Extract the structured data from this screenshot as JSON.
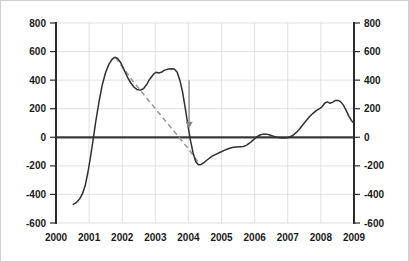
{
  "chart_data": {
    "type": "line",
    "title": "",
    "subtitle": "",
    "xlabel": "",
    "ylabel": "",
    "grid": true,
    "legend_position": "none",
    "xlim": [
      2000,
      2009
    ],
    "ylim": [
      -600,
      800
    ],
    "xticks": [
      "2000",
      "2001",
      "2002",
      "2003",
      "2004",
      "2005",
      "2006",
      "2007",
      "2008",
      "2009"
    ],
    "yticks_left": [
      "800",
      "600",
      "400",
      "200",
      "0",
      "-200",
      "-400",
      "-600"
    ],
    "yticks_right": [
      "800",
      "600",
      "400",
      "200",
      "0",
      "-200",
      "-400",
      "-600"
    ],
    "dual_axis": true,
    "zero_reference_line": 0,
    "series": [
      {
        "name": "main-series",
        "style": "solid",
        "color": "#303030",
        "points": [
          [
            2000.52,
            -470
          ],
          [
            2000.62,
            -455
          ],
          [
            2000.72,
            -430
          ],
          [
            2000.8,
            -395
          ],
          [
            2000.88,
            -340
          ],
          [
            2000.96,
            -250
          ],
          [
            2001.04,
            -140
          ],
          [
            2001.12,
            -20
          ],
          [
            2001.2,
            110
          ],
          [
            2001.3,
            250
          ],
          [
            2001.4,
            370
          ],
          [
            2001.5,
            455
          ],
          [
            2001.6,
            512
          ],
          [
            2001.7,
            548
          ],
          [
            2001.78,
            560
          ],
          [
            2001.86,
            552
          ],
          [
            2001.96,
            520
          ],
          [
            2002.06,
            470
          ],
          [
            2002.16,
            420
          ],
          [
            2002.26,
            380
          ],
          [
            2002.36,
            350
          ],
          [
            2002.44,
            335
          ],
          [
            2002.54,
            330
          ],
          [
            2002.64,
            340
          ],
          [
            2002.74,
            370
          ],
          [
            2002.84,
            410
          ],
          [
            2002.94,
            440
          ],
          [
            2003.02,
            455
          ],
          [
            2003.1,
            450
          ],
          [
            2003.18,
            455
          ],
          [
            2003.28,
            470
          ],
          [
            2003.4,
            478
          ],
          [
            2003.5,
            480
          ],
          [
            2003.58,
            476
          ],
          [
            2003.66,
            455
          ],
          [
            2003.74,
            400
          ],
          [
            2003.82,
            320
          ],
          [
            2003.9,
            210
          ],
          [
            2003.98,
            90
          ],
          [
            2004.06,
            -20
          ],
          [
            2004.14,
            -110
          ],
          [
            2004.22,
            -170
          ],
          [
            2004.3,
            -192
          ],
          [
            2004.38,
            -190
          ],
          [
            2004.48,
            -175
          ],
          [
            2004.6,
            -152
          ],
          [
            2004.72,
            -132
          ],
          [
            2004.84,
            -118
          ],
          [
            2004.96,
            -105
          ],
          [
            2005.08,
            -92
          ],
          [
            2005.2,
            -80
          ],
          [
            2005.32,
            -72
          ],
          [
            2005.44,
            -68
          ],
          [
            2005.56,
            -66
          ],
          [
            2005.66,
            -64
          ],
          [
            2005.76,
            -55
          ],
          [
            2005.86,
            -38
          ],
          [
            2005.96,
            -18
          ],
          [
            2006.06,
            2
          ],
          [
            2006.16,
            16
          ],
          [
            2006.26,
            22
          ],
          [
            2006.36,
            22
          ],
          [
            2006.46,
            16
          ],
          [
            2006.56,
            8
          ],
          [
            2006.66,
            0
          ],
          [
            2006.76,
            -4
          ],
          [
            2006.86,
            -5
          ],
          [
            2006.96,
            -4
          ],
          [
            2007.06,
            2
          ],
          [
            2007.16,
            14
          ],
          [
            2007.26,
            34
          ],
          [
            2007.36,
            60
          ],
          [
            2007.46,
            90
          ],
          [
            2007.56,
            118
          ],
          [
            2007.66,
            145
          ],
          [
            2007.76,
            168
          ],
          [
            2007.86,
            186
          ],
          [
            2007.96,
            200
          ],
          [
            2008.04,
            215
          ],
          [
            2008.12,
            240
          ],
          [
            2008.2,
            248
          ],
          [
            2008.28,
            238
          ],
          [
            2008.36,
            246
          ],
          [
            2008.44,
            258
          ],
          [
            2008.52,
            258
          ],
          [
            2008.6,
            248
          ],
          [
            2008.68,
            225
          ],
          [
            2008.76,
            190
          ],
          [
            2008.84,
            150
          ],
          [
            2008.92,
            118
          ],
          [
            2009.0,
            98
          ]
        ]
      },
      {
        "name": "trend-line",
        "style": "dashed",
        "color": "#9a9a9a",
        "points": [
          [
            2001.8,
            558
          ],
          [
            2002.3,
            400
          ],
          [
            2002.55,
            328
          ],
          [
            2003.0,
            200
          ],
          [
            2003.5,
            60
          ],
          [
            2004.0,
            -80
          ],
          [
            2004.28,
            -172
          ]
        ]
      }
    ],
    "annotations": [
      {
        "name": "down-arrow",
        "type": "arrow",
        "direction": "down",
        "x": 2004.02,
        "y_start": 400,
        "y_end": 60,
        "color": "#8a8a8a"
      }
    ]
  }
}
